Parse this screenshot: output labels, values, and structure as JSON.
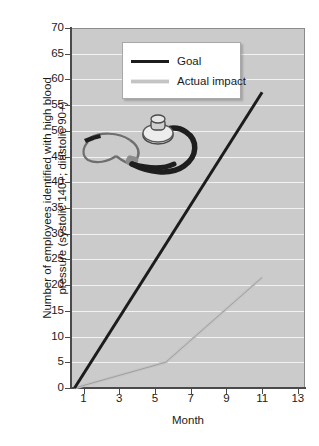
{
  "chart_data": {
    "type": "line",
    "title": "",
    "xlabel": "Month",
    "ylabel": "Number of employees identified with high blood\npressure (systolic 140+; diastolic 90+)",
    "xlim": [
      0.3,
      13.4
    ],
    "ylim": [
      0,
      70
    ],
    "ytick_step": 5,
    "grid": true,
    "gridline_color": "#f2f2f2",
    "plot_background": "#cbcbcb",
    "legend_position": "top-center",
    "xticks": [
      "1",
      "3",
      "5",
      "7",
      "9",
      "11",
      "13"
    ],
    "xtick_values": [
      1,
      3,
      5,
      7,
      9,
      11,
      13
    ],
    "yticks": [
      "0",
      "5",
      "10",
      "15",
      "20",
      "25",
      "30",
      "35",
      "40",
      "45",
      "50",
      "55",
      "60",
      "65",
      "70"
    ],
    "ytick_values": [
      0,
      5,
      10,
      15,
      20,
      25,
      30,
      35,
      40,
      45,
      50,
      55,
      60,
      65,
      70
    ],
    "series": [
      {
        "name": "Goal",
        "color": "#1c1c1c",
        "x": [
          0.5,
          11.0
        ],
        "values": [
          0,
          57.5
        ]
      },
      {
        "name": "Actual impact",
        "color": "#c4c4c4",
        "x": [
          0.5,
          5.6,
          11.0
        ],
        "values": [
          0,
          5,
          21.5
        ]
      }
    ],
    "annotations": [
      {
        "name": "stethoscope-image",
        "type": "decorative-image"
      }
    ]
  },
  "legend": {
    "entries": [
      {
        "label": "Goal"
      },
      {
        "label": "Actual impact"
      }
    ]
  },
  "axes": {
    "x_title": "Month",
    "y_title_line1": "Number of employees identified with high blood",
    "y_title_line2": "pressure (systolic 140+; diastolic 90+)"
  },
  "icons": {
    "stethoscope": "stethoscope-icon"
  },
  "colors": {
    "goal_line": "#1c1c1c",
    "actual_line": "#c4c4c4",
    "plot_bg": "#cbcbcb",
    "grid": "#f2f2f2",
    "axis": "#4a4a4a",
    "page_bg": "#ffffff"
  }
}
